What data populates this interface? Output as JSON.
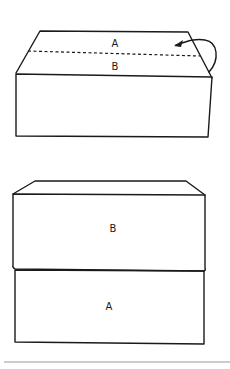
{
  "figures": [
    {
      "id": "before-fold",
      "description": "Box with top flap divided by dashed fold line; curved arrow shows flap folding",
      "labels": {
        "top_section": "A",
        "lower_section": "B"
      },
      "fold_line": "dashed",
      "arrow": "curved-fold-arrow"
    },
    {
      "id": "after-fold",
      "description": "Stacked result with B on top of A",
      "labels": {
        "upper_block": "B",
        "lower_block": "A"
      }
    }
  ],
  "colors": {
    "ink": "#1a1a1a",
    "rule": "#9a9a9a",
    "background": "#ffffff"
  }
}
